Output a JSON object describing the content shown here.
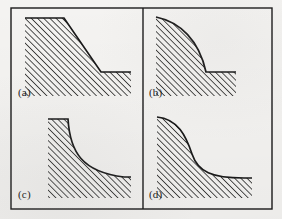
{
  "figure": {
    "type": "slope-profile-diagram",
    "panel_count": 4,
    "layout": "2x2 grid inside a single rectangular border with a central vertical divider",
    "background_color": "#f7f6f4",
    "ink_color": "#1a1a1a",
    "border": {
      "x": 11,
      "y": 8,
      "width": 261,
      "height": 201,
      "stroke_width": 1.4,
      "divider_x": 143
    },
    "hatching": {
      "angle_deg": 45,
      "direction": "lower-left to upper-right",
      "spacing_px": 3.1,
      "stroke_width": 0.85,
      "color": "#1a1a1a",
      "meaning": "ground / material below the slope surface"
    }
  },
  "panels": [
    {
      "id": "a",
      "label": "(a)",
      "label_pos": {
        "x": 18,
        "y": 86
      },
      "profile_shape": "straight",
      "description": "Planar rectilinear slope: flat crest, constant-gradient straight face, flat toe",
      "outline_path": "M 25 18 L 64 18 L 101 72 L 131 72",
      "hatch_region": "M 25 18 L 64 18 L 101 72 L 131 72 L 131 96 L 25 96 Z",
      "crest": {
        "x1": 25,
        "y1": 18,
        "x2": 64,
        "y2": 18
      },
      "face": {
        "x1": 64,
        "y1": 18,
        "x2": 101,
        "y2": 72
      },
      "toe": {
        "x1": 101,
        "y1": 72,
        "x2": 131,
        "y2": 72
      }
    },
    {
      "id": "b",
      "label": "(b)",
      "label_pos": {
        "x": 149,
        "y": 86
      },
      "profile_shape": "convex",
      "description": "Convex slope: gentle near the crest, steepening progressively downslope to a sharp toe break and flat toe",
      "outline_path": "M 156 17 C 180 22, 199 40, 206 72 L 236 72",
      "hatch_region": "M 156 17 C 180 22, 199 40, 206 72 L 236 72 L 236 96 L 156 96 Z",
      "crest": {
        "x": 156,
        "y": 17
      },
      "toe": {
        "x1": 206,
        "y1": 72,
        "x2": 236,
        "y2": 72
      }
    },
    {
      "id": "c",
      "label": "(c)",
      "label_pos": {
        "x": 18,
        "y": 188
      },
      "profile_shape": "concave",
      "description": "Concave slope: short flat crest, steep upper face that flattens asymptotically toward a gentle toe",
      "outline_path": "M 48 119 L 68 119 C 70 152, 82 172, 124 177 L 131 177",
      "hatch_region": "M 48 119 L 68 119 C 70 152, 82 172, 124 177 L 131 177 L 131 198 L 48 198 Z",
      "crest": {
        "x1": 48,
        "y1": 119,
        "x2": 68,
        "y2": 119
      },
      "toe": {
        "x1": 124,
        "y1": 177,
        "x2": 131,
        "y2": 177
      }
    },
    {
      "id": "d",
      "label": "(d)",
      "label_pos": {
        "x": 149,
        "y": 188
      },
      "profile_shape": "sigmoid",
      "description": "Sigmoidal S-shaped slope: convex upper segment, mid-slope inflection, concave lower segment merging into a gentle toe",
      "outline_path": "M 157 117 C 178 119, 186 136, 192 154 C 198 172, 212 178, 244 178 L 252 178",
      "hatch_region": "M 157 117 C 178 119, 186 136, 192 154 C 198 172, 212 178, 244 178 L 252 178 L 252 198 L 157 198 Z",
      "crest": {
        "x": 157,
        "y": 117
      },
      "inflection": {
        "x": 192,
        "y": 154
      },
      "toe": {
        "x1": 244,
        "y1": 178,
        "x2": 252,
        "y2": 178
      }
    }
  ]
}
